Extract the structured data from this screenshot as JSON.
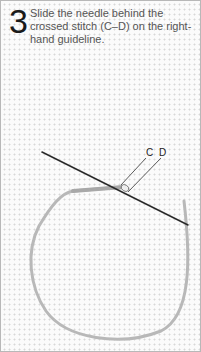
{
  "instruction": {
    "step_number": "3",
    "text": "Slide the needle behind the crossed stitch (C–D) on the right-hand guideline."
  },
  "illustration": {
    "subject": "needle threaded through crossed stitch on Aida cloth",
    "labels": {
      "c": "C",
      "d": "D"
    },
    "colors": {
      "needle": "#2a2a2a",
      "thread": "#b5b5b5",
      "grid": "#d8d8d8",
      "border": "#b8b8b8"
    }
  }
}
